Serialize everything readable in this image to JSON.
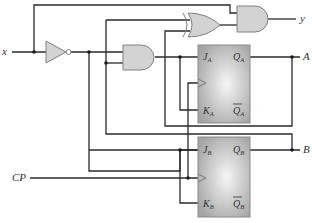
{
  "diagram": {
    "type": "sequential-logic-circuit",
    "inputs": [
      {
        "id": "x",
        "label": "x"
      },
      {
        "id": "cp",
        "label": "CP"
      }
    ],
    "outputs": [
      {
        "id": "y",
        "label": "y"
      },
      {
        "id": "A",
        "label": "A"
      },
      {
        "id": "B",
        "label": "B"
      }
    ],
    "gates": [
      {
        "id": "inverter",
        "kind": "NOT"
      },
      {
        "id": "and-mid",
        "kind": "AND"
      },
      {
        "id": "xor",
        "kind": "XOR"
      },
      {
        "id": "and-top",
        "kind": "AND"
      }
    ],
    "flip_flops": [
      {
        "id": "ff-a",
        "kind": "JK",
        "pins": {
          "j": "J",
          "j_sub": "A",
          "k": "K",
          "k_sub": "A",
          "q": "Q",
          "q_sub": "A",
          "qbar": "Q",
          "qbar_sub": "A"
        }
      },
      {
        "id": "ff-b",
        "kind": "JK",
        "pins": {
          "j": "J",
          "j_sub": "B",
          "k": "K",
          "k_sub": "B",
          "q": "Q",
          "q_sub": "B",
          "qbar": "Q",
          "qbar_sub": "B"
        }
      }
    ],
    "colors": {
      "gate_fill": "#d3d3d3",
      "wire": "#2a2a2a",
      "ff_fill_center": "#f4f4f4",
      "ff_fill_edge": "#a9a9a9"
    }
  }
}
